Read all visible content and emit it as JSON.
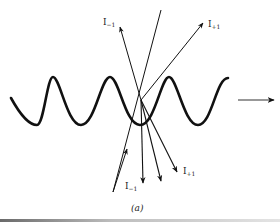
{
  "figure": {
    "caption": "(a)",
    "labels": {
      "upper_left": {
        "base": "I",
        "sub": "−1"
      },
      "upper_right": {
        "base": "I",
        "sub": "+1"
      },
      "lower_left": {
        "base": "I",
        "sub": "−1"
      },
      "lower_right": {
        "base": "I",
        "sub": "+1"
      }
    },
    "colors": {
      "stroke": "#111111",
      "background": "#ffffff"
    }
  }
}
